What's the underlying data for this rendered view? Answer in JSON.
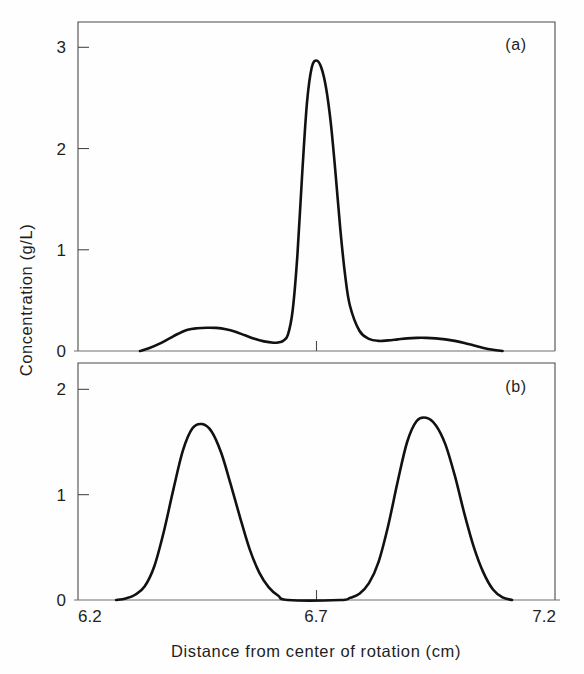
{
  "figure": {
    "background_color": "#fefefe",
    "curve_color": "#111111",
    "axis_color": "#4a4a4a"
  },
  "axes": {
    "x_axis_title": "Distance from center of rotation (cm)",
    "y_axis_title": "Concentration (g/L)",
    "x_ticks": [
      "6.2",
      "6.7",
      "7.2"
    ],
    "panel_a_y_ticks": [
      "0",
      "1",
      "2",
      "3"
    ],
    "panel_b_y_ticks": [
      "0",
      "1",
      "2"
    ]
  },
  "panels": {
    "a": {
      "label": "(a)"
    },
    "b": {
      "label": "(b)"
    }
  },
  "chart_data": [
    {
      "type": "line",
      "panel": "(a)",
      "title": "",
      "xlabel": "Distance from center of rotation (cm)",
      "ylabel": "Concentration (g/L)",
      "xlim": [
        6.2,
        7.2
      ],
      "ylim": [
        0,
        3.25
      ],
      "xticks": [
        6.2,
        6.7,
        7.2
      ],
      "yticks": [
        0,
        1,
        2,
        3
      ],
      "grid": false,
      "legend": "none",
      "peaks": [
        {
          "x": 6.49,
          "y": 0.23,
          "name": "minor-shoulder-peak"
        },
        {
          "x": 6.69,
          "y": 2.87,
          "name": "main-peak"
        },
        {
          "x": 6.93,
          "y": 0.13,
          "name": "trailing-bump"
        }
      ],
      "x": [
        6.33,
        6.35,
        6.37,
        6.39,
        6.41,
        6.43,
        6.45,
        6.47,
        6.49,
        6.51,
        6.53,
        6.55,
        6.57,
        6.59,
        6.61,
        6.62,
        6.63,
        6.64,
        6.65,
        6.66,
        6.67,
        6.68,
        6.69,
        6.7,
        6.71,
        6.72,
        6.73,
        6.74,
        6.75,
        6.76,
        6.77,
        6.79,
        6.81,
        6.83,
        6.85,
        6.87,
        6.89,
        6.91,
        6.93,
        6.95,
        6.97,
        6.99,
        7.01,
        7.03,
        7.05,
        7.07,
        7.09
      ],
      "y": [
        0.0,
        0.03,
        0.07,
        0.12,
        0.17,
        0.21,
        0.225,
        0.23,
        0.228,
        0.215,
        0.19,
        0.155,
        0.12,
        0.095,
        0.082,
        0.085,
        0.1,
        0.16,
        0.4,
        0.95,
        1.75,
        2.45,
        2.8,
        2.87,
        2.8,
        2.6,
        2.25,
        1.75,
        1.2,
        0.75,
        0.45,
        0.2,
        0.12,
        0.1,
        0.105,
        0.115,
        0.125,
        0.13,
        0.13,
        0.125,
        0.115,
        0.1,
        0.08,
        0.055,
        0.03,
        0.012,
        0.0
      ]
    },
    {
      "type": "line",
      "panel": "(b)",
      "title": "",
      "xlabel": "Distance from center of rotation (cm)",
      "ylabel": "Concentration (g/L)",
      "xlim": [
        6.2,
        7.2
      ],
      "ylim": [
        0,
        2.25
      ],
      "xticks": [
        6.2,
        6.7,
        7.2
      ],
      "yticks": [
        0,
        1,
        2
      ],
      "grid": false,
      "legend": "none",
      "peaks": [
        {
          "x": 6.46,
          "y": 1.67,
          "name": "left-peak"
        },
        {
          "x": 6.93,
          "y": 1.73,
          "name": "right-peak"
        }
      ],
      "x": [
        6.28,
        6.3,
        6.32,
        6.34,
        6.36,
        6.38,
        6.4,
        6.42,
        6.44,
        6.46,
        6.48,
        6.5,
        6.52,
        6.54,
        6.56,
        6.58,
        6.6,
        6.62,
        6.64,
        6.75,
        6.77,
        6.79,
        6.81,
        6.83,
        6.85,
        6.87,
        6.89,
        6.91,
        6.93,
        6.95,
        6.97,
        6.99,
        7.01,
        7.03,
        7.05,
        7.07,
        7.09,
        7.11
      ],
      "y": [
        0.0,
        0.015,
        0.05,
        0.13,
        0.32,
        0.65,
        1.05,
        1.42,
        1.63,
        1.67,
        1.6,
        1.4,
        1.1,
        0.78,
        0.48,
        0.26,
        0.12,
        0.04,
        0.0,
        0.0,
        0.02,
        0.06,
        0.16,
        0.36,
        0.7,
        1.12,
        1.5,
        1.7,
        1.73,
        1.66,
        1.48,
        1.18,
        0.82,
        0.5,
        0.26,
        0.1,
        0.025,
        0.0
      ]
    }
  ],
  "geometry": {
    "plot_left": 78,
    "plot_right": 555,
    "panel_a_top": 22,
    "panel_a_baseline": 351,
    "panel_b_top": 363,
    "panel_b_baseline": 600
  }
}
